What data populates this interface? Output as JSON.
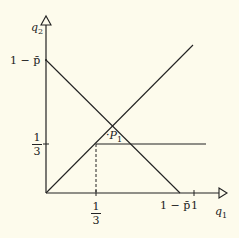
{
  "diagram": {
    "axes": {
      "x_label": "q",
      "x_sub": "1",
      "y_label": "q",
      "y_sub": "2"
    },
    "y_ticks": {
      "top": "1 − p̄",
      "third_num": "1",
      "third_den": "3"
    },
    "x_ticks": {
      "third_num": "1",
      "third_den": "3",
      "one_minus_p": "1 − p̄",
      "one": "1"
    },
    "point": {
      "label": "P",
      "sub": "1"
    },
    "colors": {
      "background": "#fdfbec",
      "line": "#222222"
    }
  }
}
